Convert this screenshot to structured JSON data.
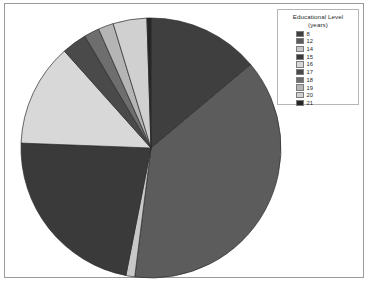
{
  "frame": {
    "background": "#ffffff",
    "border_color": "#9a9a9a"
  },
  "legend": {
    "title_line1": "Educational Level",
    "title_line2": "(years)",
    "entries": [
      {
        "label": "8",
        "color": "#3f3f3f"
      },
      {
        "label": "12",
        "color": "#5c5c5c"
      },
      {
        "label": "14",
        "color": "#c8c8c8"
      },
      {
        "label": "15",
        "color": "#3a3a3a"
      },
      {
        "label": "16",
        "color": "#d8d8d8"
      },
      {
        "label": "17",
        "color": "#4a4a4a"
      },
      {
        "label": "18",
        "color": "#6e6e6e"
      },
      {
        "label": "19",
        "color": "#b5b5b5"
      },
      {
        "label": "20",
        "color": "#d0d0d0"
      },
      {
        "label": "21",
        "color": "#262626"
      }
    ]
  },
  "chart_data": {
    "type": "pie",
    "title": "",
    "legend_title": "Educational Level (years)",
    "legend_position": "top-right",
    "categories": [
      "8",
      "12",
      "14",
      "15",
      "16",
      "17",
      "18",
      "19",
      "20",
      "21"
    ],
    "values": [
      13.9,
      38.1,
      1.1,
      22.5,
      12.8,
      3.1,
      1.9,
      1.9,
      4.2,
      0.5
    ],
    "units": "percent",
    "colors": [
      "#3f3f3f",
      "#5c5c5c",
      "#c8c8c8",
      "#3a3a3a",
      "#d8d8d8",
      "#4a4a4a",
      "#6e6e6e",
      "#b5b5b5",
      "#d0d0d0",
      "#262626"
    ],
    "start_angle_deg": 0,
    "direction": "clockwise",
    "center": {
      "x": 146,
      "y": 144
    },
    "radius": 130,
    "slice_boundaries_deg": [
      0,
      50,
      18762,
      191,
      272,
      318,
      329,
      336,
      343,
      358,
      360
    ],
    "xlabel": "",
    "ylabel": ""
  }
}
